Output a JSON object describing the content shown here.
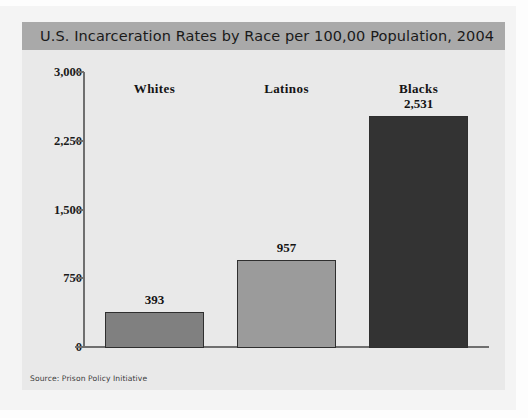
{
  "figure": {
    "title": "U.S. Incarceration Rates by Race per 100,00 Population, 2004",
    "source": "Source: Prison Policy Initiative",
    "title_bar_color": "#a9a9a9",
    "plot_background": "#e9e9e9",
    "axis_color": "#6f6f6f"
  },
  "chart_data": {
    "type": "bar",
    "title": "U.S. Incarceration Rates by Race per 100,00 Population, 2004",
    "xlabel": "",
    "ylabel": "",
    "categories": [
      "Whites",
      "Latinos",
      "Blacks"
    ],
    "values": [
      393,
      957,
      2531
    ],
    "value_labels": [
      "393",
      "957",
      "2,531"
    ],
    "colors": [
      "#808080",
      "#9b9b9b",
      "#333333"
    ],
    "ylim": [
      0,
      3000
    ],
    "yticks": [
      3000,
      2250,
      1500,
      750,
      0
    ],
    "ytick_labels": [
      "3,000",
      "2,250",
      "1,500",
      "750",
      "0"
    ],
    "grid": false,
    "legend": false,
    "annotations": [
      "Source: Prison Policy Initiative"
    ]
  }
}
